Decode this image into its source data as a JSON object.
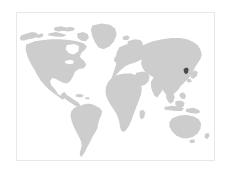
{
  "page": {
    "title": "World Map",
    "width": 231,
    "height": 174,
    "background_color": "#ffffff"
  },
  "map": {
    "name": "world-map",
    "projection": "equirectangular",
    "frame": {
      "x": 16,
      "y": 12,
      "width": 199,
      "height": 149,
      "border_color": "#e8e8e8",
      "background_color": "#ffffff"
    },
    "land_color": "#cdcdcd",
    "ocean_color": "#ffffff",
    "highlight_color": "#4a4a4a",
    "highlighted_region": {
      "label": "South Korea",
      "continent": "Asia",
      "x": 176,
      "y": 79
    },
    "regions": [
      {
        "label": "North America",
        "color": "#cdcdcd"
      },
      {
        "label": "South America",
        "color": "#cdcdcd"
      },
      {
        "label": "Europe",
        "color": "#cdcdcd"
      },
      {
        "label": "Africa",
        "color": "#cdcdcd"
      },
      {
        "label": "Asia",
        "color": "#cdcdcd"
      },
      {
        "label": "Australia",
        "color": "#cdcdcd"
      },
      {
        "label": "Greenland",
        "color": "#cdcdcd"
      }
    ]
  },
  "chart_data": {
    "type": "map",
    "title": "World Map",
    "xlabel": "",
    "ylabel": "",
    "legend": [],
    "categories": [
      "North America",
      "South America",
      "Europe",
      "Africa",
      "Asia",
      "Australia",
      "Greenland",
      "South Korea"
    ],
    "values": [
      0,
      0,
      0,
      0,
      0,
      0,
      0,
      1
    ],
    "color_scale": {
      "base": "#cdcdcd",
      "highlight": "#4a4a4a"
    },
    "highlighted": [
      "South Korea"
    ]
  }
}
